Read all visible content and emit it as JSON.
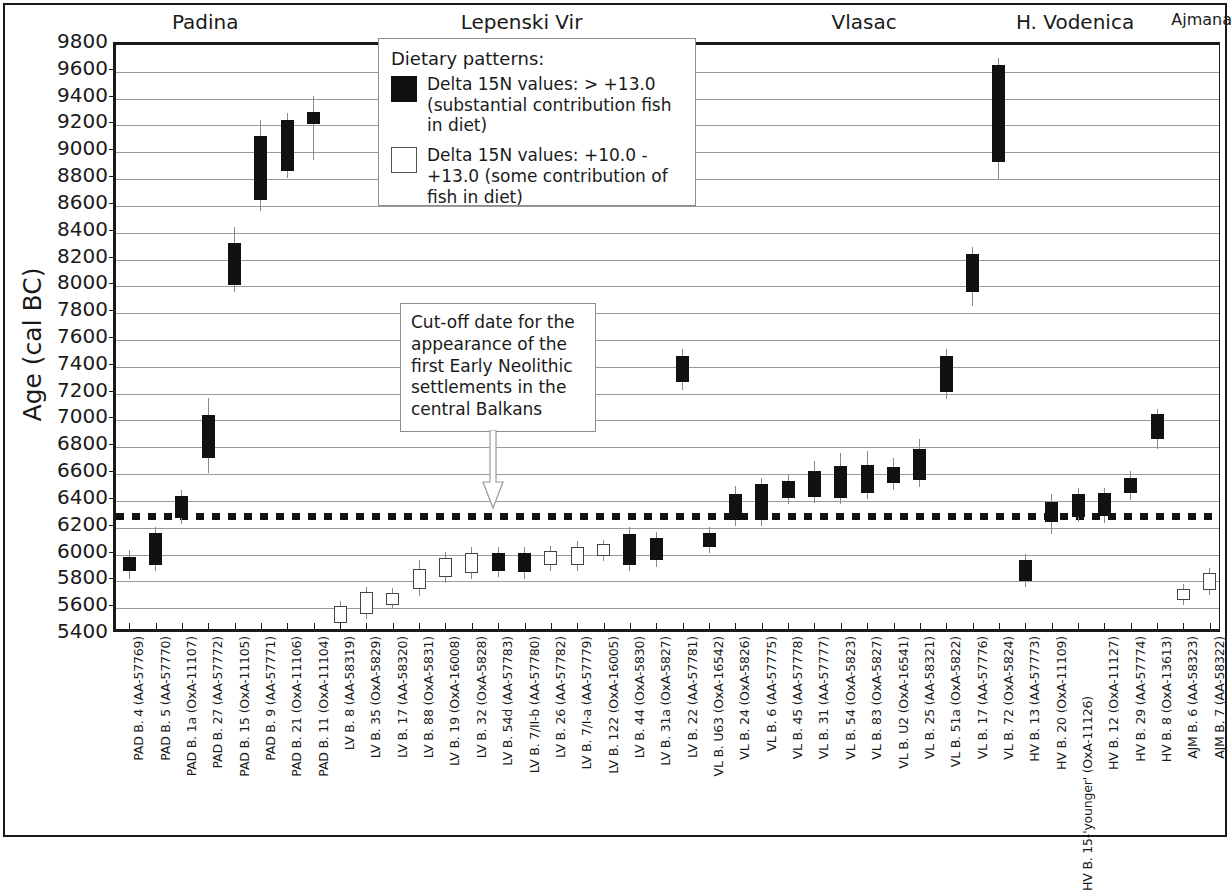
{
  "axis": {
    "ylabel": "Age (cal BC)",
    "yticks": [
      9800,
      9600,
      9400,
      9200,
      9000,
      8800,
      8600,
      8400,
      8200,
      8000,
      7800,
      7600,
      7400,
      7200,
      7000,
      6800,
      6600,
      6400,
      6200,
      6000,
      5800,
      5600,
      5400
    ]
  },
  "sites": [
    {
      "name": "Padina",
      "start": 0,
      "end": 7
    },
    {
      "name": "Lepenski Vir",
      "start": 7,
      "end": 24
    },
    {
      "name": "Vlasac",
      "start": 24,
      "end": 33
    },
    {
      "name": "H. Vodenica",
      "start": 33,
      "end": 40
    },
    {
      "name": "Ajmana",
      "start": 40,
      "end": 42
    }
  ],
  "legend": {
    "title": "Dietary patterns:",
    "entries": [
      {
        "swatch": "filled",
        "text": "Delta 15N values: > +13.0 (substantial contribution fish in diet)"
      },
      {
        "swatch": "open",
        "text": "Delta 15N values: +10.0 - +13.0 (some contribution of fish in diet)"
      }
    ]
  },
  "annotation": {
    "text": "Cut-off date for the appearance of the first Early Neolithic settlements in the central Balkans",
    "cutoff_value": 6290
  },
  "chart_data": {
    "type": "bar",
    "title": "",
    "xlabel": "",
    "ylabel": "Age (cal BC)",
    "ylim": [
      5400,
      9800
    ],
    "ytick_step": 200,
    "grid": true,
    "legend_position": "inside-top-center",
    "categories": [
      "PAD B. 4 (AA-57769)",
      "PAD B. 5 (AA-57770)",
      "PAD B. 1a (OxA-11107)",
      "PAD B. 27 (AA-57772)",
      "PAD B. 15 (OxA-11105)",
      "PAD B. 9 (AA-57771)",
      "PAD B. 21 (OxA-11106)",
      "PAD B. 11 (OxA-11104)",
      "LV B. 8 (AA-58319)",
      "LV B. 35 (OxA-5829)",
      "LV B. 17 (AA-58320)",
      "LV B. 88 (OxA-5831)",
      "LV B. 19 (OxA-16008)",
      "LV B. 32 (OxA-5828)",
      "LV B. 54d (AA-57783)",
      "LV B. 7/II-b (AA-57780)",
      "LV B. 26 (AA-57782)",
      "LV B. 7/I-a (AA-57779)",
      "LV B. 122 (OxA-16005)",
      "LV B. 44 (OxA-5830)",
      "LV B. 31a (OxA-5827)",
      "LV B. 22 (AA-57781)",
      "VL B. U63 (OxA-16542)",
      "VL B. 24 (OxA-5826)",
      "VL B. 6 (AA-57775)",
      "VL B. 45 (AA-57778)",
      "VL B. 31 (AA-57777)",
      "VL B. 54 (OxA-5823)",
      "VL B. 83 (OxA-5827)",
      "VL B. U2 (OxA-16541)",
      "VL B. 25 (AA-58321)",
      "VL B. 51a (OxA-5822)",
      "VL B. 17 (AA-57776)",
      "VL B. 72 (OxA-5824)",
      "HV B. 13 (AA-57773)",
      "HV B. 20 (OxA-11109)",
      "HV B. 15-'younger' (OxA-11126)",
      "HV B. 12 (OxA-11127)",
      "HV B. 29 (AA-57774)",
      "HV B. 8 (OxA-13613)",
      "AJM B. 6 (AA-58323)",
      "AJM B. 7 (AA-58322)"
    ],
    "series": [
      {
        "name": "Calibrated date ranges",
        "points": [
          {
            "label": "PAD B. 4 (AA-57769)",
            "fill": "filled",
            "box_low": 5880,
            "box_high": 5985,
            "whisker_low": 5820,
            "whisker_high": 6035
          },
          {
            "label": "PAD B. 5 (AA-57770)",
            "fill": "filled",
            "box_low": 5925,
            "box_high": 6160,
            "whisker_low": 5880,
            "whisker_high": 6205
          },
          {
            "label": "PAD B. 1a (OxA-11107)",
            "fill": "filled",
            "box_low": 6270,
            "box_high": 6440,
            "whisker_low": 6230,
            "whisker_high": 6480
          },
          {
            "label": "PAD B. 27 (AA-57772)",
            "fill": "filled",
            "box_low": 6720,
            "box_high": 7040,
            "whisker_low": 6610,
            "whisker_high": 7170
          },
          {
            "label": "PAD B. 15 (OxA-11105)",
            "fill": "filled",
            "box_low": 8010,
            "box_high": 8320,
            "whisker_low": 7960,
            "whisker_high": 8440
          },
          {
            "label": "PAD B. 9 (AA-57771)",
            "fill": "filled",
            "box_low": 8645,
            "box_high": 9120,
            "whisker_low": 8560,
            "whisker_high": 9240
          },
          {
            "label": "PAD B. 21 (OxA-11106)",
            "fill": "filled",
            "box_low": 8860,
            "box_high": 9240,
            "whisker_low": 8810,
            "whisker_high": 9290
          },
          {
            "label": "PAD B. 11 (OxA-11104)",
            "fill": "filled",
            "box_low": 9210,
            "box_high": 9300,
            "whisker_low": 8940,
            "whisker_high": 9420
          },
          {
            "label": "LV B. 8 (AA-58319)",
            "fill": "open",
            "box_low": 5490,
            "box_high": 5615,
            "whisker_low": 5460,
            "whisker_high": 5655
          },
          {
            "label": "LV B. 35 (OxA-5829)",
            "fill": "open",
            "box_low": 5560,
            "box_high": 5720,
            "whisker_low": 5520,
            "whisker_high": 5760
          },
          {
            "label": "LV B. 17 (AA-58320)",
            "fill": "open",
            "box_low": 5625,
            "box_high": 5715,
            "whisker_low": 5595,
            "whisker_high": 5750
          },
          {
            "label": "LV B. 88 (OxA-5831)",
            "fill": "open",
            "box_low": 5740,
            "box_high": 5895,
            "whisker_low": 5690,
            "whisker_high": 5960
          },
          {
            "label": "LV B. 19 (OxA-16008)",
            "fill": "open",
            "box_low": 5835,
            "box_high": 5975,
            "whisker_low": 5790,
            "whisker_high": 6020
          },
          {
            "label": "LV B. 32 (OxA-5828)",
            "fill": "open",
            "box_low": 5865,
            "box_high": 6010,
            "whisker_low": 5820,
            "whisker_high": 6060
          },
          {
            "label": "LV B. 54d (AA-57783)",
            "fill": "filled",
            "box_low": 5880,
            "box_high": 6010,
            "whisker_low": 5835,
            "whisker_high": 6055
          },
          {
            "label": "LV B. 7/II-b (AA-57780)",
            "fill": "filled",
            "box_low": 5870,
            "box_high": 6015,
            "whisker_low": 5820,
            "whisker_high": 6060
          },
          {
            "label": "LV B. 26 (AA-57782)",
            "fill": "open",
            "box_low": 5925,
            "box_high": 6025,
            "whisker_low": 5880,
            "whisker_high": 6065
          },
          {
            "label": "LV B. 7/I-a (AA-57779)",
            "fill": "open",
            "box_low": 5920,
            "box_high": 6055,
            "whisker_low": 5875,
            "whisker_high": 6100
          },
          {
            "label": "LV B. 122 (OxA-16005)",
            "fill": "open",
            "box_low": 5990,
            "box_high": 6075,
            "whisker_low": 5955,
            "whisker_high": 6110
          },
          {
            "label": "LV B. 44 (OxA-5830)",
            "fill": "filled",
            "box_low": 5920,
            "box_high": 6155,
            "whisker_low": 5880,
            "whisker_high": 6205
          },
          {
            "label": "LV B. 31a (OxA-5827)",
            "fill": "filled",
            "box_low": 5960,
            "box_high": 6120,
            "whisker_low": 5905,
            "whisker_high": 6170
          },
          {
            "label": "LV B. 22 (AA-57781)",
            "fill": "filled",
            "box_low": 7290,
            "box_high": 7480,
            "whisker_low": 7225,
            "whisker_high": 7530
          },
          {
            "label": "VL B. U63 (OxA-16542)",
            "fill": "filled",
            "box_low": 6055,
            "box_high": 6160,
            "whisker_low": 6010,
            "whisker_high": 6205
          },
          {
            "label": "VL B. 24 (OxA-5826)",
            "fill": "filled",
            "box_low": 6260,
            "box_high": 6450,
            "whisker_low": 6215,
            "whisker_high": 6510
          },
          {
            "label": "VL B. 6 (AA-57775)",
            "fill": "filled",
            "box_low": 6255,
            "box_high": 6525,
            "whisker_low": 6210,
            "whisker_high": 6570
          },
          {
            "label": "VL B. 45 (AA-57778)",
            "fill": "filled",
            "box_low": 6420,
            "box_high": 6550,
            "whisker_low": 6380,
            "whisker_high": 6600
          },
          {
            "label": "VL B. 31 (AA-57777)",
            "fill": "filled",
            "box_low": 6430,
            "box_high": 6620,
            "whisker_low": 6385,
            "whisker_high": 6700
          },
          {
            "label": "VL B. 54 (OxA-5823)",
            "fill": "filled",
            "box_low": 6420,
            "box_high": 6660,
            "whisker_low": 6375,
            "whisker_high": 6760
          },
          {
            "label": "VL B. 83 (OxA-5827)",
            "fill": "filled",
            "box_low": 6460,
            "box_high": 6665,
            "whisker_low": 6415,
            "whisker_high": 6775
          },
          {
            "label": "VL B. U2 (OxA-16541)",
            "fill": "filled",
            "box_low": 6530,
            "box_high": 6655,
            "whisker_low": 6480,
            "whisker_high": 6720
          },
          {
            "label": "VL B. 25 (AA-58321)",
            "fill": "filled",
            "box_low": 6555,
            "box_high": 6790,
            "whisker_low": 6505,
            "whisker_high": 6865
          },
          {
            "label": "VL B. 51a (OxA-5822)",
            "fill": "filled",
            "box_low": 7215,
            "box_high": 7480,
            "whisker_low": 7160,
            "whisker_high": 7535
          },
          {
            "label": "VL B. 17 (AA-57776)",
            "fill": "filled",
            "box_low": 7960,
            "box_high": 8240,
            "whisker_low": 7855,
            "whisker_high": 8290
          },
          {
            "label": "VL B. 72 (OxA-5824)",
            "fill": "filled",
            "box_low": 8930,
            "box_high": 9650,
            "whisker_low": 8800,
            "whisker_high": 9700
          },
          {
            "label": "HV B. 13 (AA-57773)",
            "fill": "filled",
            "box_low": 5800,
            "box_high": 5960,
            "whisker_low": 5760,
            "whisker_high": 6005
          },
          {
            "label": "HV B. 20 (OxA-11109)",
            "fill": "filled",
            "box_low": 6240,
            "box_high": 6395,
            "whisker_low": 6155,
            "whisker_high": 6450
          },
          {
            "label": "HV B. 15-'younger' (OxA-11126)",
            "fill": "filled",
            "box_low": 6280,
            "box_high": 6450,
            "whisker_low": 6240,
            "whisker_high": 6495
          },
          {
            "label": "HV B. 12 (OxA-11127)",
            "fill": "filled",
            "box_low": 6285,
            "box_high": 6460,
            "whisker_low": 6235,
            "whisker_high": 6500
          },
          {
            "label": "HV B. 29 (AA-57774)",
            "fill": "filled",
            "box_low": 6460,
            "box_high": 6570,
            "whisker_low": 6410,
            "whisker_high": 6625
          },
          {
            "label": "HV B. 8 (OxA-13613)",
            "fill": "filled",
            "box_low": 6860,
            "box_high": 7045,
            "whisker_low": 6790,
            "whisker_high": 7085
          },
          {
            "label": "AJM B. 6 (AA-58323)",
            "fill": "open",
            "box_low": 5660,
            "box_high": 5740,
            "whisker_low": 5620,
            "whisker_high": 5780
          },
          {
            "label": "AJM B. 7 (AA-58322)",
            "fill": "open",
            "box_low": 5735,
            "box_high": 5865,
            "whisker_low": 5700,
            "whisker_high": 5900
          }
        ]
      }
    ]
  }
}
